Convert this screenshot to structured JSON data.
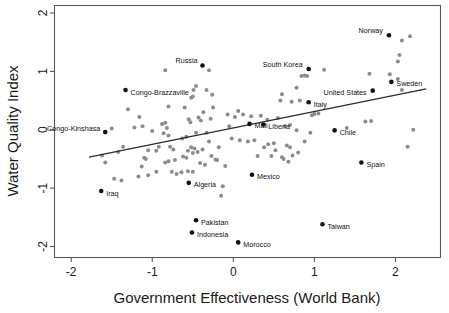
{
  "chart_data": {
    "type": "scatter",
    "title": "",
    "xlabel": "Government Effectiveness (World Bank)",
    "ylabel": "Water Quality Index",
    "xlim": [
      -2.2,
      2.55
    ],
    "ylim": [
      -2.18,
      2.12
    ],
    "xticks": [
      -2,
      -1,
      0,
      1,
      2
    ],
    "xtick_labels": [
      "-2",
      "-1",
      "0",
      "1",
      "2"
    ],
    "yticks": [
      -2,
      -1,
      0,
      1,
      2
    ],
    "ytick_labels": [
      "-2",
      "-1",
      "0",
      "1",
      "2"
    ],
    "grid": false,
    "legend": "none",
    "marker_color_unlabeled": "#8c8c8c",
    "marker_color_labeled": "#111111",
    "fit_line": {
      "label": "linear fit",
      "color": "#2b2b2b",
      "x_start": -1.78,
      "y_start": -0.47,
      "x_end": 2.38,
      "y_end": 0.7
    },
    "labeled_points": [
      {
        "name": "Norway",
        "x": 1.92,
        "y": 1.62,
        "label_dx": -6,
        "label_dy": -5,
        "anchor": "end"
      },
      {
        "name": "Russia",
        "x": -0.38,
        "y": 1.1,
        "label_dx": -5,
        "label_dy": -5,
        "anchor": "end"
      },
      {
        "name": "South Korea",
        "x": 0.93,
        "y": 1.04,
        "label_dx": -6,
        "label_dy": -5,
        "anchor": "end"
      },
      {
        "name": "Sweden",
        "x": 1.95,
        "y": 0.82,
        "label_dx": 5,
        "label_dy": 2,
        "anchor": "start"
      },
      {
        "name": "United States",
        "x": 1.72,
        "y": 0.67,
        "label_dx": -6,
        "label_dy": 2,
        "anchor": "end"
      },
      {
        "name": "Congo-Brazzaville",
        "x": -1.33,
        "y": 0.68,
        "label_dx": 5,
        "label_dy": 2,
        "anchor": "start"
      },
      {
        "name": "Italy",
        "x": 0.93,
        "y": 0.47,
        "label_dx": 5,
        "label_dy": 2,
        "anchor": "start"
      },
      {
        "name": "Mali",
        "x": 0.2,
        "y": 0.1,
        "label_dx": 5,
        "label_dy": 2,
        "anchor": "start"
      },
      {
        "name": "Liberia",
        "x": 0.37,
        "y": 0.09,
        "label_dx": 5,
        "label_dy": 2,
        "anchor": "start"
      },
      {
        "name": "Congo-Kinshasa",
        "x": -1.58,
        "y": -0.04,
        "label_dx": -5,
        "label_dy": -4,
        "anchor": "end"
      },
      {
        "name": "Chile",
        "x": 1.25,
        "y": -0.01,
        "label_dx": 5,
        "label_dy": 2,
        "anchor": "start"
      },
      {
        "name": "Spain",
        "x": 1.58,
        "y": -0.56,
        "label_dx": 5,
        "label_dy": 2,
        "anchor": "start"
      },
      {
        "name": "Mexico",
        "x": 0.23,
        "y": -0.77,
        "label_dx": 5,
        "label_dy": 2,
        "anchor": "start"
      },
      {
        "name": "Algeria",
        "x": -0.55,
        "y": -0.91,
        "label_dx": 5,
        "label_dy": 2,
        "anchor": "start"
      },
      {
        "name": "Iraq",
        "x": -1.63,
        "y": -1.05,
        "label_dx": 5,
        "label_dy": 2,
        "anchor": "start"
      },
      {
        "name": "Pakistan",
        "x": -0.46,
        "y": -1.55,
        "label_dx": 5,
        "label_dy": 2,
        "anchor": "start"
      },
      {
        "name": "Taiwan",
        "x": 1.1,
        "y": -1.62,
        "label_dx": 5,
        "label_dy": 2,
        "anchor": "start"
      },
      {
        "name": "Indonesia",
        "x": -0.51,
        "y": -1.76,
        "label_dx": 5,
        "label_dy": 2,
        "anchor": "start"
      },
      {
        "name": "Morocco",
        "x": 0.06,
        "y": -1.93,
        "label_dx": 5,
        "label_dy": 2,
        "anchor": "start"
      }
    ],
    "unlabeled_points": [
      {
        "x": 2.18,
        "y": 1.6
      },
      {
        "x": 2.08,
        "y": 1.53
      },
      {
        "x": 2.05,
        "y": 1.28
      },
      {
        "x": 2.03,
        "y": 1.17
      },
      {
        "x": 1.93,
        "y": 0.95
      },
      {
        "x": 1.68,
        "y": 0.96
      },
      {
        "x": 2.03,
        "y": 0.87
      },
      {
        "x": 2.08,
        "y": 0.68
      },
      {
        "x": 2.22,
        "y": 0.0
      },
      {
        "x": 2.15,
        "y": -0.29
      },
      {
        "x": 1.7,
        "y": 0.15
      },
      {
        "x": 1.63,
        "y": 0.14
      },
      {
        "x": 1.12,
        "y": 1.03
      },
      {
        "x": 0.88,
        "y": 0.93
      },
      {
        "x": 0.91,
        "y": 0.92
      },
      {
        "x": 0.84,
        "y": 0.92
      },
      {
        "x": 1.05,
        "y": 0.28
      },
      {
        "x": 1.0,
        "y": 0.27
      },
      {
        "x": 0.97,
        "y": 0.25
      },
      {
        "x": 0.78,
        "y": 0.72
      },
      {
        "x": 0.82,
        "y": 0.5
      },
      {
        "x": 0.72,
        "y": 0.48
      },
      {
        "x": 0.64,
        "y": 0.06
      },
      {
        "x": 0.7,
        "y": 0.08
      },
      {
        "x": 0.6,
        "y": 0.61
      },
      {
        "x": 0.58,
        "y": 0.5
      },
      {
        "x": 0.55,
        "y": 0.2
      },
      {
        "x": 0.78,
        "y": -0.01
      },
      {
        "x": 0.8,
        "y": -0.39
      },
      {
        "x": 0.73,
        "y": -0.44
      },
      {
        "x": 0.68,
        "y": -0.55
      },
      {
        "x": 0.62,
        "y": -0.5
      },
      {
        "x": 0.6,
        "y": -0.47
      },
      {
        "x": 0.7,
        "y": -0.3
      },
      {
        "x": 0.66,
        "y": -0.27
      },
      {
        "x": 0.5,
        "y": -0.23
      },
      {
        "x": 0.43,
        "y": -0.25
      },
      {
        "x": 0.38,
        "y": -0.3
      },
      {
        "x": 0.52,
        "y": -0.35
      },
      {
        "x": 0.47,
        "y": -0.45
      },
      {
        "x": 0.3,
        "y": -0.45
      },
      {
        "x": 0.26,
        "y": -0.18
      },
      {
        "x": 0.18,
        "y": -0.2
      },
      {
        "x": 0.22,
        "y": 0.23
      },
      {
        "x": 0.12,
        "y": 0.26
      },
      {
        "x": 0.06,
        "y": 0.32
      },
      {
        "x": 0.02,
        "y": 0.22
      },
      {
        "x": -0.05,
        "y": 0.06
      },
      {
        "x": -0.02,
        "y": -0.15
      },
      {
        "x": 0.08,
        "y": -0.18
      },
      {
        "x": -0.1,
        "y": -0.62
      },
      {
        "x": -0.13,
        "y": -0.97
      },
      {
        "x": -0.15,
        "y": -1.13
      },
      {
        "x": -0.18,
        "y": -0.3
      },
      {
        "x": -0.22,
        "y": -0.51
      },
      {
        "x": -0.27,
        "y": -0.45
      },
      {
        "x": -0.3,
        "y": -0.2
      },
      {
        "x": -0.28,
        "y": 0.19
      },
      {
        "x": -0.25,
        "y": 0.38
      },
      {
        "x": -0.3,
        "y": 1.02
      },
      {
        "x": -0.33,
        "y": 0.68
      },
      {
        "x": -0.37,
        "y": 0.3
      },
      {
        "x": -0.4,
        "y": 0.16
      },
      {
        "x": -0.43,
        "y": 0.21
      },
      {
        "x": -0.46,
        "y": 0.75
      },
      {
        "x": -0.49,
        "y": 0.68
      },
      {
        "x": -0.52,
        "y": 0.55
      },
      {
        "x": -0.5,
        "y": 0.57
      },
      {
        "x": -0.55,
        "y": 0.18
      },
      {
        "x": -0.53,
        "y": 0.13
      },
      {
        "x": -0.58,
        "y": -0.12
      },
      {
        "x": -0.46,
        "y": -0.05
      },
      {
        "x": -0.48,
        "y": -0.32
      },
      {
        "x": -0.52,
        "y": -0.3
      },
      {
        "x": -0.56,
        "y": -0.36
      },
      {
        "x": -0.5,
        "y": -0.4
      },
      {
        "x": -0.44,
        "y": -0.38
      },
      {
        "x": -0.58,
        "y": -0.48
      },
      {
        "x": -0.62,
        "y": -0.46
      },
      {
        "x": -0.64,
        "y": -0.73
      },
      {
        "x": -0.56,
        "y": -0.71
      },
      {
        "x": -0.5,
        "y": -0.72
      },
      {
        "x": -0.7,
        "y": -0.76
      },
      {
        "x": -0.76,
        "y": -0.72
      },
      {
        "x": -0.72,
        "y": -0.52
      },
      {
        "x": -0.8,
        "y": -0.54
      },
      {
        "x": -0.84,
        "y": -0.56
      },
      {
        "x": -0.74,
        "y": -0.34
      },
      {
        "x": -0.78,
        "y": -0.29
      },
      {
        "x": -0.82,
        "y": 0.03
      },
      {
        "x": -0.86,
        "y": -0.06
      },
      {
        "x": -0.8,
        "y": -0.1
      },
      {
        "x": -0.84,
        "y": 0.12
      },
      {
        "x": -0.88,
        "y": 0.1
      },
      {
        "x": -0.8,
        "y": 0.4
      },
      {
        "x": -0.84,
        "y": 1.02
      },
      {
        "x": -0.92,
        "y": -0.29
      },
      {
        "x": -0.95,
        "y": -0.36
      },
      {
        "x": -1.0,
        "y": -0.02
      },
      {
        "x": -1.05,
        "y": -0.35
      },
      {
        "x": -1.1,
        "y": -0.48
      },
      {
        "x": -1.08,
        "y": -0.5
      },
      {
        "x": -1.13,
        "y": -0.63
      },
      {
        "x": -1.17,
        "y": -0.8
      },
      {
        "x": -1.05,
        "y": -0.78
      },
      {
        "x": -1.12,
        "y": 0.06
      },
      {
        "x": -1.16,
        "y": 0.22
      },
      {
        "x": -1.22,
        "y": 0.04
      },
      {
        "x": -1.3,
        "y": 0.35
      },
      {
        "x": -1.36,
        "y": -0.29
      },
      {
        "x": -1.42,
        "y": -0.38
      },
      {
        "x": -1.47,
        "y": -0.84
      },
      {
        "x": -1.38,
        "y": -0.87
      },
      {
        "x": -1.62,
        "y": -0.44
      },
      {
        "x": -1.58,
        "y": -0.56
      },
      {
        "x": -0.95,
        "y": -0.72
      },
      {
        "x": -0.6,
        "y": 0.38
      },
      {
        "x": -0.38,
        "y": -0.34
      },
      {
        "x": -0.35,
        "y": -0.6
      },
      {
        "x": -0.2,
        "y": -0.52
      },
      {
        "x": 0.42,
        "y": 0.17
      },
      {
        "x": 0.34,
        "y": 0.24
      },
      {
        "x": 1.4,
        "y": 0.03
      },
      {
        "x": 0.88,
        "y": -0.2
      },
      {
        "x": 0.95,
        "y": -0.05
      },
      {
        "x": -0.26,
        "y": 0.6
      },
      {
        "x": -0.07,
        "y": 0.26
      },
      {
        "x": -0.33,
        "y": -0.05
      },
      {
        "x": -0.41,
        "y": -0.57
      },
      {
        "x": -0.63,
        "y": -0.15
      },
      {
        "x": -1.5,
        "y": 0.02
      }
    ]
  }
}
